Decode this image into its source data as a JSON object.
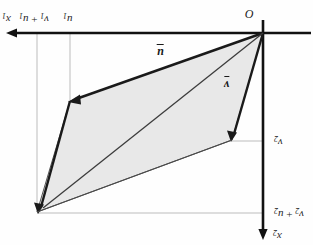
{
  "figure": {
    "type": "vector-parallelogram-diagram",
    "orientation_note": "all labels rendered rotated 180 degrees",
    "background_color": "#fefefe",
    "axis_color": "#111111",
    "guide_color": "#b8b8b8",
    "fill_color": "#e8e8e8",
    "outline_color": "#2a2a2a"
  },
  "labels": {
    "axis_horizontal": {
      "base": "x",
      "sub": "1"
    },
    "axis_vertical": {
      "base": "x",
      "sub": "2"
    },
    "origin": "O",
    "tick_sum_x1": {
      "base1": "v",
      "sub1": "1",
      "op": "+",
      "base2": "u",
      "sub2": "1"
    },
    "tick_u1": {
      "base": "u",
      "sub": "1"
    },
    "tick_v2": {
      "base": "v",
      "sub": "2"
    },
    "tick_sum_x2": {
      "base1": "v",
      "sub1": "2",
      "op": "+",
      "base2": "u",
      "sub2": "2"
    },
    "vector_u": "u",
    "vector_v": "v"
  },
  "geometry": {
    "origin_px": [
      263,
      33
    ],
    "vertex_u_px": [
      70,
      101
    ],
    "vertex_v_px": [
      232,
      140
    ],
    "vertex_sum_px": [
      37,
      212
    ],
    "h_axis_arrow_tip_px": [
      8,
      33
    ],
    "h_axis_end_px": [
      311,
      33
    ],
    "v_axis_arrow_tip_px": [
      263,
      238
    ],
    "v_axis_start_px": [
      263,
      20
    ],
    "guide_ticks_x": [
      37,
      70
    ],
    "guide_ticks_y": [
      141,
      213
    ]
  }
}
